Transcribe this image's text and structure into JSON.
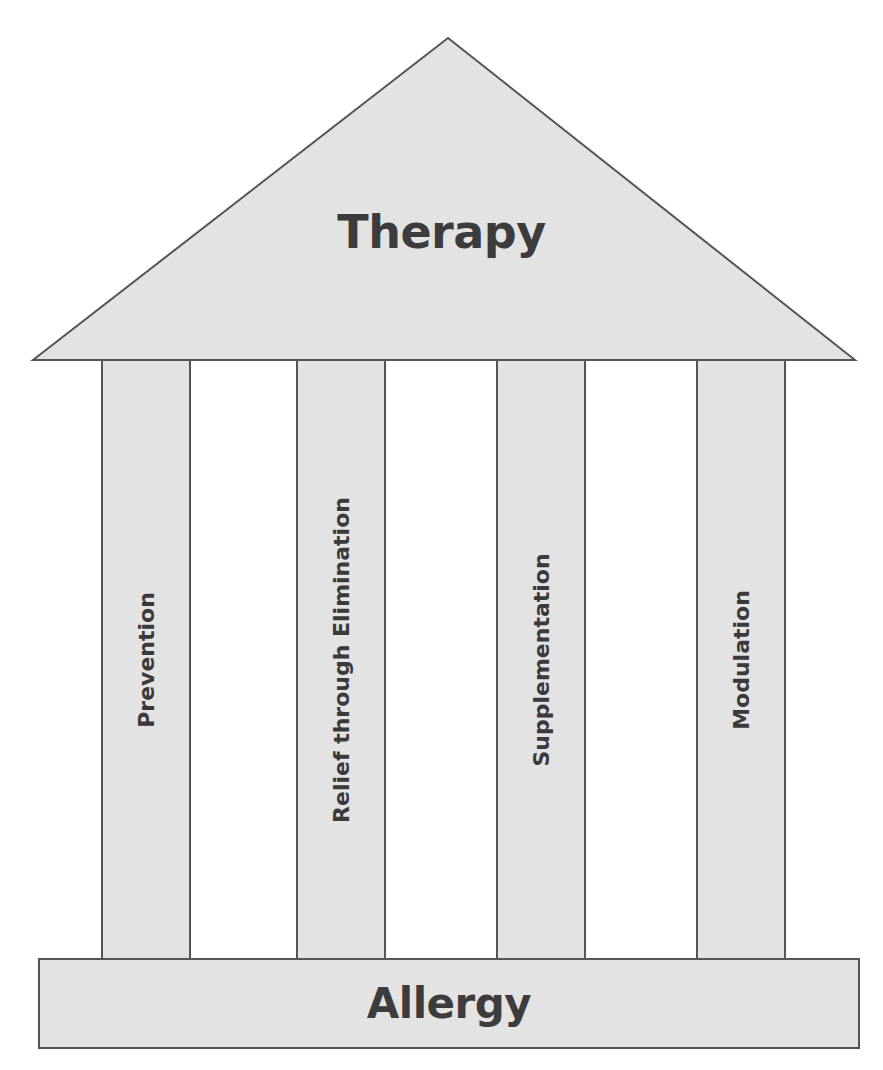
{
  "diagram": {
    "type": "temple-metaphor",
    "roof": {
      "label": "Therapy"
    },
    "pillars": [
      {
        "label": "Prevention"
      },
      {
        "label": "Relief through Elimination"
      },
      {
        "label": "Supplementation"
      },
      {
        "label": "Modulation"
      }
    ],
    "base": {
      "label": "Allergy"
    },
    "colors": {
      "fill": "#e3e3e3",
      "stroke": "#555555",
      "text": "#3a3a3a",
      "background": "#ffffff"
    }
  }
}
